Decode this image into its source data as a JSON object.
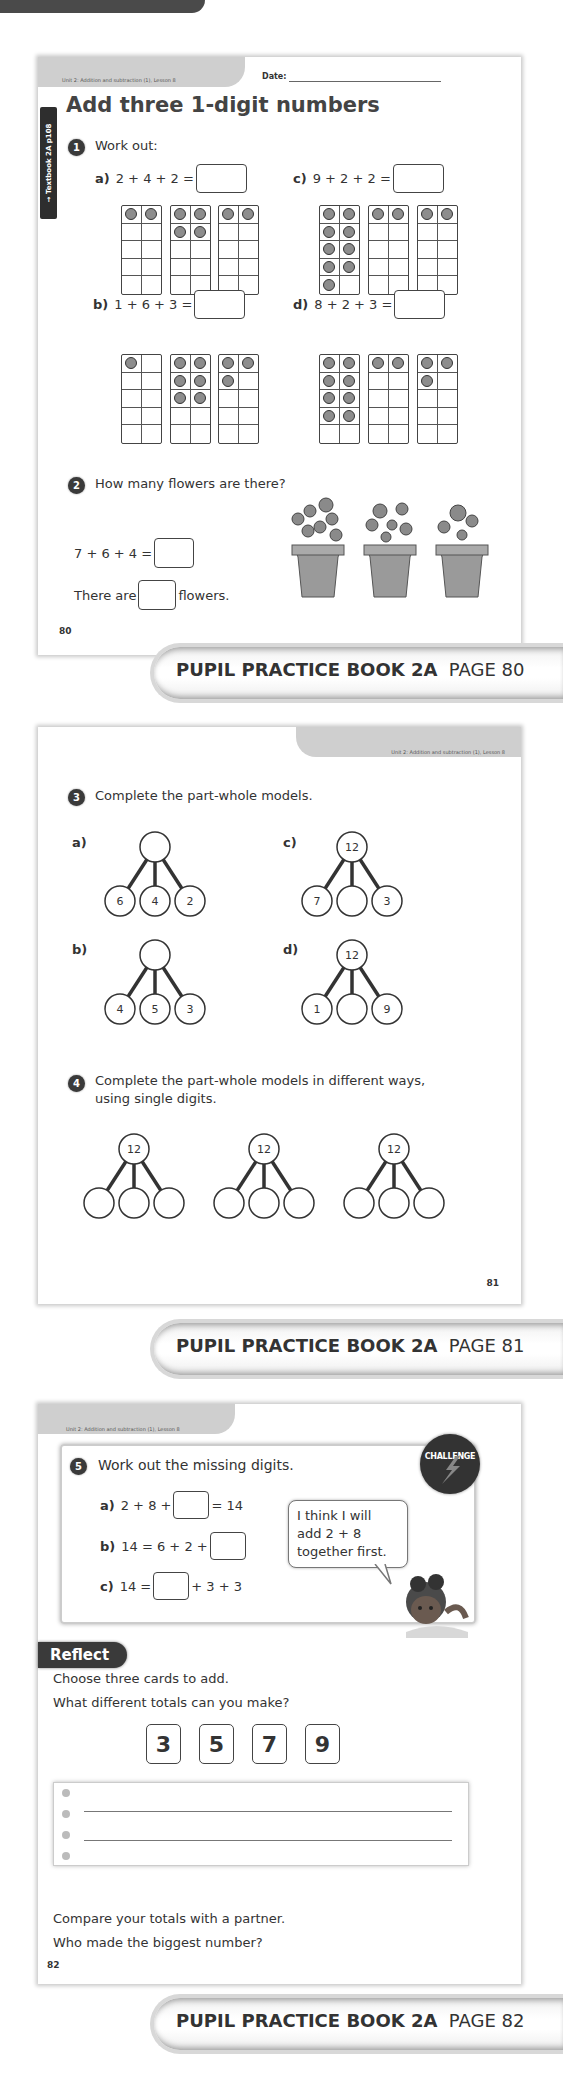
{
  "pages": [
    {
      "header": {
        "unit": "Unit 2: Addition and subtraction (1), Lesson 8",
        "date_label": "Date:"
      },
      "side_tab": "→ Textbook 2A p108",
      "title": "Add three 1-digit numbers",
      "q1": {
        "number": "1",
        "prompt": "Work out:",
        "parts": [
          {
            "label": "a)",
            "expr": "2 + 4 + 2 =",
            "frames": [
              2,
              4,
              2
            ]
          },
          {
            "label": "c)",
            "expr": "9 + 2 + 2 =",
            "frames": [
              9,
              2,
              2
            ]
          },
          {
            "label": "b)",
            "expr": "1 + 6 + 3 =",
            "frames": [
              1,
              6,
              3
            ]
          },
          {
            "label": "d)",
            "expr": "8 + 2 + 3 =",
            "frames": [
              8,
              2,
              3
            ]
          }
        ]
      },
      "q2": {
        "number": "2",
        "prompt": "How many flowers are there?",
        "expr": "7 + 6 + 4 =",
        "sentence_before": "There are",
        "sentence_after": "flowers.",
        "pots": [
          7,
          6,
          4
        ]
      },
      "page_number": "80",
      "footer": {
        "book": "PUPIL PRACTICE BOOK 2A",
        "page": "PAGE 80"
      }
    },
    {
      "header": {
        "unit": "Unit 2: Addition and subtraction (1), Lesson 8"
      },
      "q3": {
        "number": "3",
        "prompt": "Complete the part-whole models.",
        "models": [
          {
            "label": "a)",
            "whole": "",
            "parts": [
              "6",
              "4",
              "2"
            ]
          },
          {
            "label": "c)",
            "whole": "12",
            "parts": [
              "7",
              "",
              "3"
            ]
          },
          {
            "label": "b)",
            "whole": "",
            "parts": [
              "4",
              "5",
              "3"
            ]
          },
          {
            "label": "d)",
            "whole": "12",
            "parts": [
              "1",
              "",
              "9"
            ]
          }
        ]
      },
      "q4": {
        "number": "4",
        "prompt_line1": "Complete the part-whole models in different ways,",
        "prompt_line2": "using single digits.",
        "models": [
          {
            "whole": "12",
            "parts": [
              "",
              "",
              ""
            ]
          },
          {
            "whole": "12",
            "parts": [
              "",
              "",
              ""
            ]
          },
          {
            "whole": "12",
            "parts": [
              "",
              "",
              ""
            ]
          }
        ]
      },
      "page_number": "81",
      "footer": {
        "book": "PUPIL PRACTICE BOOK 2A",
        "page": "PAGE 81"
      }
    },
    {
      "header": {
        "unit": "Unit 2: Addition and subtraction (1), Lesson 8"
      },
      "q5": {
        "number": "5",
        "prompt": "Work out the missing digits.",
        "badge": "CHALLENGE",
        "parts": [
          {
            "label": "a)",
            "before": "2 + 8 +",
            "after": "= 14"
          },
          {
            "label": "b)",
            "before": "14 = 6 + 2 +",
            "after": ""
          },
          {
            "label": "c)",
            "before": "14 =",
            "after": "+ 3 + 3"
          }
        ],
        "speech": [
          "I think I will",
          "add 2 + 8",
          "together first."
        ]
      },
      "reflect": {
        "label": "Reflect",
        "line1": "Choose three cards to add.",
        "line2": "What different totals can you make?",
        "cards": [
          "3",
          "5",
          "7",
          "9"
        ],
        "closing1": "Compare your totals with a partner.",
        "closing2": "Who made the biggest number?"
      },
      "page_number": "82",
      "footer": {
        "book": "PUPIL PRACTICE BOOK 2A",
        "page": "PAGE 82"
      }
    }
  ]
}
